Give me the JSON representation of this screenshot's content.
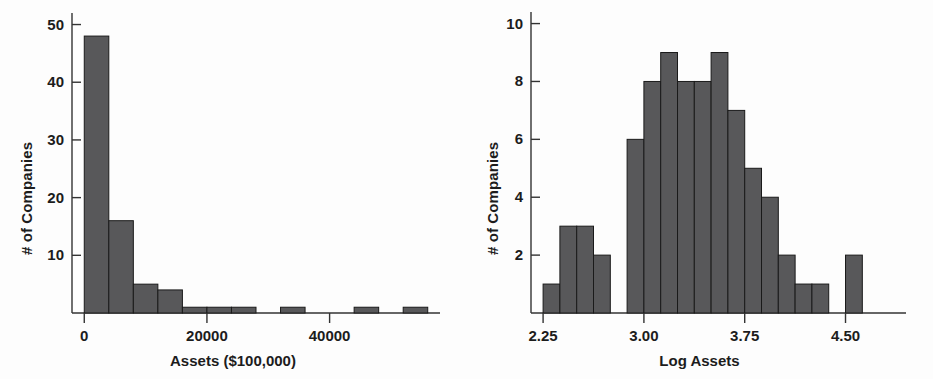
{
  "figure": {
    "background": "#fdfdfd",
    "bar_fill": "#58585a",
    "bar_stroke": "#1a1a1a",
    "axis_color": "#333333"
  },
  "chart_data": [
    {
      "type": "bar",
      "id": "assets-histogram",
      "title": "",
      "xlabel": "Assets ($100,000)",
      "ylabel": "# of Companies",
      "xlim": [
        -2000,
        58000
      ],
      "ylim": [
        0,
        52
      ],
      "xticks": [
        0,
        20000,
        40000
      ],
      "xticklabels": [
        "0",
        "20000",
        "40000"
      ],
      "yticks": [
        10,
        20,
        30,
        40,
        50
      ],
      "yticklabels": [
        "10",
        "20",
        "30",
        "40",
        "50"
      ],
      "grid": false,
      "legend": "none",
      "bin_width": 4000,
      "bin_edges": [
        0,
        4000,
        8000,
        12000,
        16000,
        20000,
        24000,
        28000,
        32000,
        36000,
        40000,
        44000,
        48000,
        52000,
        56000
      ],
      "values": [
        48,
        16,
        5,
        4,
        1,
        1,
        1,
        0,
        1,
        0,
        0,
        1,
        0,
        1
      ]
    },
    {
      "type": "bar",
      "id": "log-assets-histogram",
      "title": "",
      "xlabel": "Log Assets",
      "ylabel": "# of Companies",
      "xlim": [
        2.16,
        4.95
      ],
      "ylim": [
        0,
        10.4
      ],
      "xticks": [
        2.25,
        3.0,
        3.75,
        4.5
      ],
      "xticklabels": [
        "2.25",
        "3.00",
        "3.75",
        "4.50"
      ],
      "yticks": [
        2,
        4,
        6,
        8,
        10
      ],
      "yticklabels": [
        "2",
        "4",
        "6",
        "8",
        "10"
      ],
      "grid": false,
      "legend": "none",
      "bin_width": 0.125,
      "bin_edges": [
        2.25,
        2.375,
        2.5,
        2.625,
        2.75,
        2.875,
        3.0,
        3.125,
        3.25,
        3.375,
        3.5,
        3.625,
        3.75,
        3.875,
        4.0,
        4.125,
        4.25,
        4.375,
        4.5,
        4.625,
        4.75
      ],
      "values": [
        1,
        3,
        3,
        2,
        0,
        6,
        8,
        9,
        8,
        8,
        9,
        7,
        5,
        4,
        2,
        1,
        1,
        0,
        2,
        0
      ]
    }
  ]
}
